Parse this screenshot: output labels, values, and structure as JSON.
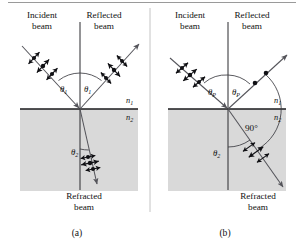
{
  "figure": {
    "background_color": "#ffffff",
    "medium_fill_color": "#d9d9d9",
    "ray_color": "#54545a",
    "ink_color": "#101014",
    "panels": [
      {
        "id": "a",
        "caption": "(a)",
        "incident_label_line1": "Incident",
        "incident_label_line2": "beam",
        "reflected_label_line1": "Reflected",
        "reflected_label_line2": "beam",
        "refracted_label_line1": "Refracted",
        "refracted_label_line2": "beam",
        "index_upper": "n",
        "index_upper_sub": "1",
        "index_lower": "n",
        "index_lower_sub": "2",
        "angle_incident": "θ",
        "angle_incident_sub": "1",
        "angle_reflected": "θ",
        "angle_reflected_sub": "1",
        "angle_refracted": "θ",
        "angle_refracted_sub": "2",
        "incident_polarization": "unpolarized-dots-and-double-arrows",
        "reflected_polarization": "partially-polarized-dots-and-double-arrows",
        "refracted_polarization": "partially-polarized-dots-and-double-arrows",
        "has_right_angle_marker": false,
        "right_angle_label": ""
      },
      {
        "id": "b",
        "caption": "(b)",
        "incident_label_line1": "Incident",
        "incident_label_line2": "beam",
        "reflected_label_line1": "Reflected",
        "reflected_label_line2": "beam",
        "refracted_label_line1": "Refracted",
        "refracted_label_line2": "beam",
        "index_upper": "n",
        "index_upper_sub": "1",
        "index_lower": "n",
        "index_lower_sub": "2",
        "angle_incident": "θ",
        "angle_incident_sub": "P",
        "angle_reflected": "θ",
        "angle_reflected_sub": "P",
        "angle_refracted": "θ",
        "angle_refracted_sub": "2",
        "incident_polarization": "unpolarized-dots-and-double-arrows",
        "reflected_polarization": "fully-polarized-dots-only",
        "refracted_polarization": "polarized-double-arrows-only",
        "has_right_angle_marker": true,
        "right_angle_label": "90°"
      }
    ]
  }
}
